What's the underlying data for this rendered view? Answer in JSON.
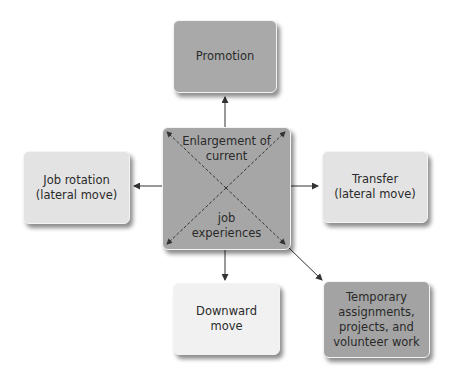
{
  "diagram": {
    "center": {
      "label_top": "Enlargement of\ncurrent",
      "label_top_line1": "Enlargement of",
      "label_top_line2": "current",
      "label_bottom_line1": "job",
      "label_bottom_line2": "experiences"
    },
    "boxes": {
      "promotion": {
        "line1": "Promotion"
      },
      "job_rotation": {
        "line1": "Job rotation",
        "line2": "(lateral move)"
      },
      "transfer": {
        "line1": "Transfer",
        "line2": "(lateral move)"
      },
      "downward_move": {
        "line1": "Downward",
        "line2": "move"
      },
      "temporary": {
        "line1": "Temporary",
        "line2": "assignments,",
        "line3": "projects, and",
        "line4": "volunteer work"
      }
    },
    "colors": {
      "promotion": "#a9a9a9",
      "center": "#a6a6a6",
      "job_rotation": "#e3e3e3",
      "transfer": "#e3e3e3",
      "downward_move": "#f1f1f1",
      "temporary": "#a3a3a3",
      "arrow": "#333333"
    }
  }
}
